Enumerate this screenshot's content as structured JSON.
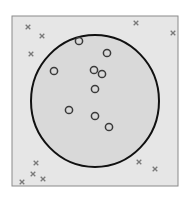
{
  "diagram": {
    "type": "scatter-with-decision-boundary",
    "colors": {
      "background": "#ffffff",
      "box_fill": "#e6e6e6",
      "box_stroke": "#8a8a8a",
      "circle_fill": "#d9d9d9",
      "circle_stroke": "#111111",
      "cross_color": "#7a7a7a",
      "ring_color": "#3a3a3a"
    },
    "box": {
      "x": 12,
      "y": 16,
      "width": 166,
      "height": 170
    },
    "boundary_circle": {
      "cx": 95,
      "cy": 101,
      "rx": 64,
      "ry": 66
    },
    "class_outside_crosses": [
      {
        "x": 28,
        "y": 27
      },
      {
        "x": 42,
        "y": 36
      },
      {
        "x": 31,
        "y": 54
      },
      {
        "x": 136,
        "y": 23
      },
      {
        "x": 173,
        "y": 33
      },
      {
        "x": 36,
        "y": 163
      },
      {
        "x": 33,
        "y": 174
      },
      {
        "x": 43,
        "y": 179
      },
      {
        "x": 22,
        "y": 182
      },
      {
        "x": 139,
        "y": 162
      },
      {
        "x": 155,
        "y": 169
      }
    ],
    "class_inside_circles": [
      {
        "x": 79,
        "y": 41
      },
      {
        "x": 107,
        "y": 53
      },
      {
        "x": 54,
        "y": 71
      },
      {
        "x": 94,
        "y": 70
      },
      {
        "x": 102,
        "y": 74
      },
      {
        "x": 95,
        "y": 89
      },
      {
        "x": 69,
        "y": 110
      },
      {
        "x": 95,
        "y": 116
      },
      {
        "x": 109,
        "y": 127
      }
    ]
  }
}
